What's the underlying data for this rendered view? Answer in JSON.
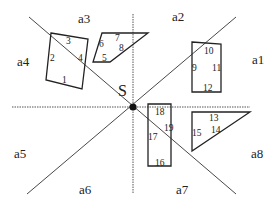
{
  "diagram": {
    "type": "spatial-direction-partition",
    "center": {
      "label": "S",
      "x": 133,
      "y": 107
    },
    "colors": {
      "stroke": "#222222",
      "dotted": "#555555",
      "background": "#ffffff"
    },
    "region_labels": [
      {
        "id": "a1",
        "label": "a1",
        "x": 252,
        "y": 64
      },
      {
        "id": "a2",
        "label": "a2",
        "x": 172,
        "y": 21
      },
      {
        "id": "a3",
        "label": "a3",
        "x": 78,
        "y": 23
      },
      {
        "id": "a4",
        "label": "a4",
        "x": 17,
        "y": 66
      },
      {
        "id": "a5",
        "label": "a5",
        "x": 14,
        "y": 158
      },
      {
        "id": "a6",
        "label": "a6",
        "x": 79,
        "y": 194
      },
      {
        "id": "a7",
        "label": "a7",
        "x": 176,
        "y": 194
      },
      {
        "id": "a8",
        "label": "a8",
        "x": 251,
        "y": 158
      }
    ],
    "objects": [
      {
        "id": "quad-left",
        "edges": [
          {
            "label": "1",
            "x": 62,
            "y": 83
          },
          {
            "label": "2",
            "x": 50,
            "y": 61
          },
          {
            "label": "3",
            "x": 66,
            "y": 44
          },
          {
            "label": "4",
            "x": 78,
            "y": 61
          }
        ]
      },
      {
        "id": "quad-top",
        "edges": [
          {
            "label": "5",
            "x": 102,
            "y": 61
          },
          {
            "label": "6",
            "x": 99,
            "y": 47
          },
          {
            "label": "7",
            "x": 115,
            "y": 41
          },
          {
            "label": "8",
            "x": 119,
            "y": 51
          }
        ]
      },
      {
        "id": "rect-right",
        "edges": [
          {
            "label": "9",
            "x": 192,
            "y": 71
          },
          {
            "label": "10",
            "x": 204,
            "y": 54
          },
          {
            "label": "11",
            "x": 212,
            "y": 71
          },
          {
            "label": "12",
            "x": 203,
            "y": 91
          }
        ]
      },
      {
        "id": "triangle-right",
        "edges": [
          {
            "label": "13",
            "x": 209,
            "y": 121
          },
          {
            "label": "14",
            "x": 211,
            "y": 133
          },
          {
            "label": "15",
            "x": 192,
            "y": 136
          }
        ]
      },
      {
        "id": "rect-bottom",
        "edges": [
          {
            "label": "16",
            "x": 155,
            "y": 166
          },
          {
            "label": "17",
            "x": 148,
            "y": 140
          },
          {
            "label": "18",
            "x": 155,
            "y": 115
          },
          {
            "label": "19",
            "x": 164,
            "y": 131
          }
        ]
      }
    ]
  }
}
